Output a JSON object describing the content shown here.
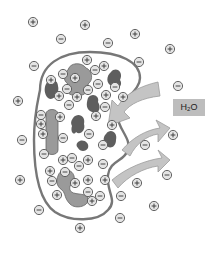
{
  "diagram": {
    "label": {
      "formula_main": "H",
      "formula_sub": "2",
      "formula_tail": "O",
      "bg": "#bdbdbd"
    },
    "colors": {
      "membrane": "#777777",
      "organelle_light": "#9a9a9a",
      "organelle_dark": "#5e5e5e",
      "arrow_fill": "#c4c4c4",
      "arrow_stroke": "#9c9c9c",
      "ion_fill": "#e4e4e4",
      "ion_stroke": "#555555"
    },
    "ions_outside": [
      {
        "x": 33,
        "y": 22,
        "sign": "+"
      },
      {
        "x": 85,
        "y": 25,
        "sign": "+"
      },
      {
        "x": 135,
        "y": 34,
        "sign": "+"
      },
      {
        "x": 61,
        "y": 39,
        "sign": "-"
      },
      {
        "x": 108,
        "y": 43,
        "sign": "-"
      },
      {
        "x": 170,
        "y": 49,
        "sign": "+"
      },
      {
        "x": 139,
        "y": 62,
        "sign": "-"
      },
      {
        "x": 34,
        "y": 66,
        "sign": "-"
      },
      {
        "x": 178,
        "y": 86,
        "sign": "-"
      },
      {
        "x": 18,
        "y": 101,
        "sign": "+"
      },
      {
        "x": 22,
        "y": 140,
        "sign": "-"
      },
      {
        "x": 173,
        "y": 135,
        "sign": "+"
      },
      {
        "x": 145,
        "y": 145,
        "sign": "-"
      },
      {
        "x": 167,
        "y": 175,
        "sign": "-"
      },
      {
        "x": 20,
        "y": 180,
        "sign": "+"
      },
      {
        "x": 137,
        "y": 183,
        "sign": "+"
      },
      {
        "x": 154,
        "y": 206,
        "sign": "+"
      },
      {
        "x": 39,
        "y": 210,
        "sign": "-"
      },
      {
        "x": 120,
        "y": 218,
        "sign": "-"
      },
      {
        "x": 80,
        "y": 228,
        "sign": "+"
      },
      {
        "x": 121,
        "y": 196,
        "sign": "-"
      }
    ],
    "ions_inside": [
      {
        "x": 87,
        "y": 60,
        "sign": "+"
      },
      {
        "x": 63,
        "y": 74,
        "sign": "-"
      },
      {
        "x": 95,
        "y": 70,
        "sign": "-"
      },
      {
        "x": 75,
        "y": 78,
        "sign": "+"
      },
      {
        "x": 51,
        "y": 80,
        "sign": "+"
      },
      {
        "x": 104,
        "y": 66,
        "sign": "+"
      },
      {
        "x": 98,
        "y": 84,
        "sign": "-"
      },
      {
        "x": 88,
        "y": 90,
        "sign": "-"
      },
      {
        "x": 67,
        "y": 89,
        "sign": "-"
      },
      {
        "x": 59,
        "y": 96,
        "sign": "+"
      },
      {
        "x": 77,
        "y": 97,
        "sign": "+"
      },
      {
        "x": 106,
        "y": 95,
        "sign": "+"
      },
      {
        "x": 69,
        "y": 105,
        "sign": "-"
      },
      {
        "x": 41,
        "y": 115,
        "sign": "-"
      },
      {
        "x": 60,
        "y": 117,
        "sign": "+"
      },
      {
        "x": 96,
        "y": 116,
        "sign": "+"
      },
      {
        "x": 105,
        "y": 107,
        "sign": "-"
      },
      {
        "x": 115,
        "y": 87,
        "sign": "-"
      },
      {
        "x": 123,
        "y": 97,
        "sign": "+"
      },
      {
        "x": 112,
        "y": 125,
        "sign": "+"
      },
      {
        "x": 43,
        "y": 134,
        "sign": "+"
      },
      {
        "x": 63,
        "y": 138,
        "sign": "-"
      },
      {
        "x": 89,
        "y": 134,
        "sign": "-"
      },
      {
        "x": 103,
        "y": 145,
        "sign": "-"
      },
      {
        "x": 44,
        "y": 154,
        "sign": "-"
      },
      {
        "x": 63,
        "y": 160,
        "sign": "+"
      },
      {
        "x": 88,
        "y": 160,
        "sign": "+"
      },
      {
        "x": 103,
        "y": 164,
        "sign": "-"
      },
      {
        "x": 79,
        "y": 166,
        "sign": "-"
      },
      {
        "x": 105,
        "y": 180,
        "sign": "+"
      },
      {
        "x": 50,
        "y": 171,
        "sign": "+"
      },
      {
        "x": 65,
        "y": 172,
        "sign": "-"
      },
      {
        "x": 52,
        "y": 181,
        "sign": "-"
      },
      {
        "x": 75,
        "y": 183,
        "sign": "+"
      },
      {
        "x": 88,
        "y": 180,
        "sign": "+"
      },
      {
        "x": 88,
        "y": 192,
        "sign": "-"
      },
      {
        "x": 57,
        "y": 195,
        "sign": "+"
      },
      {
        "x": 92,
        "y": 201,
        "sign": "+"
      },
      {
        "x": 100,
        "y": 196,
        "sign": "-"
      },
      {
        "x": 41,
        "y": 124,
        "sign": "+"
      },
      {
        "x": 72,
        "y": 158,
        "sign": "-"
      }
    ]
  }
}
